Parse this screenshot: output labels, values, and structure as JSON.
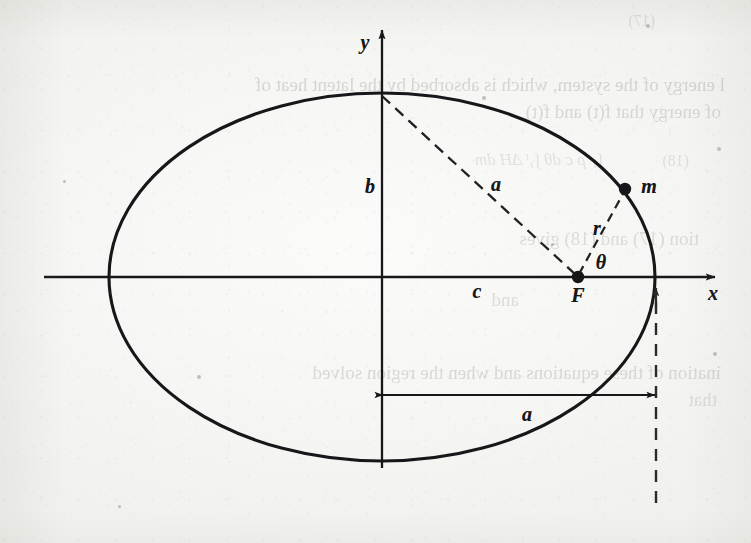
{
  "figure": {
    "kind": "ellipse-orbit-diagram",
    "caption_text": "",
    "ink_color": "#17171a",
    "paper_color": "#f6f6f4",
    "ghost_text_color": "#8d8a84"
  },
  "axes": {
    "x_label": "x",
    "y_label": "y",
    "x_axis": {
      "x1": 44,
      "y1": 277,
      "x2": 715,
      "y2": 277,
      "arrow": "right"
    },
    "y_axis": {
      "x1": 382,
      "y1": 468,
      "x2": 382,
      "y2": 30,
      "arrow": "up"
    },
    "x_label_pos": {
      "x": 713,
      "y": 293
    },
    "y_label_pos": {
      "x": 365,
      "y": 42
    }
  },
  "ellipse": {
    "center": {
      "x": 382,
      "y": 277
    },
    "semi_major_a": 273,
    "semi_minor_b": 184,
    "stroke_width": 3.1
  },
  "labels": {
    "semi_minor": {
      "text": "b",
      "x": 370,
      "y": 186
    },
    "focal_distance": {
      "text": "c",
      "x": 477,
      "y": 291
    },
    "semi_major_dashed": {
      "text": "a",
      "x": 496,
      "y": 184
    },
    "semi_major_dim": {
      "text": "a",
      "x": 527,
      "y": 414
    },
    "radius": {
      "text": "r",
      "x": 597,
      "y": 228
    },
    "angle": {
      "text": "θ",
      "x": 601,
      "y": 262
    },
    "focus_point": {
      "text": "F",
      "x": 578,
      "y": 295
    },
    "mass_point": {
      "text": "m",
      "x": 649,
      "y": 186
    }
  },
  "points": [
    {
      "name": "focus",
      "label": "F",
      "x": 578,
      "y": 277,
      "radius": 6.2
    },
    {
      "name": "orbiting-mass",
      "label": "m",
      "x": 625,
      "y": 189,
      "radius": 6.2
    }
  ],
  "dashed_lines": [
    {
      "name": "semi-major-axis-a",
      "x1": 382,
      "y1": 96,
      "x2": 576,
      "y2": 275
    },
    {
      "name": "radius-vector-r",
      "x1": 579,
      "y1": 274,
      "x2": 624,
      "y2": 192
    }
  ],
  "dimension_line": {
    "name": "semi-major-a-dimension",
    "x1": 383,
    "y1": 395,
    "x2": 655,
    "y2": 395,
    "arrows": "both",
    "label": "a"
  },
  "projection_line": {
    "name": "right-vertex-projection",
    "x": 656,
    "y_top": 288,
    "y_bottom": 509,
    "arrow": "up"
  },
  "chart_data": {
    "type": "scatter",
    "title": "",
    "xlabel": "x",
    "ylabel": "y",
    "annotations": [
      "a",
      "b",
      "c",
      "r",
      "θ",
      "F",
      "m",
      "a"
    ],
    "curve": {
      "name": "elliptical orbit",
      "equation": "x^2/a^2 + y^2/b^2 = 1",
      "center": [
        0,
        0
      ],
      "a": 273,
      "b": 184
    },
    "markers": [
      {
        "label": "F",
        "description": "focus of ellipse on positive x-axis",
        "x": 196,
        "y": 0
      },
      {
        "label": "m",
        "description": "orbiting mass on ellipse",
        "x": 243,
        "y": 88
      }
    ],
    "segments": [
      {
        "label": "a",
        "from": "top vertex (0, b)",
        "to": "F",
        "style": "dashed"
      },
      {
        "label": "r",
        "from": "F",
        "to": "m",
        "style": "dashed"
      },
      {
        "label": "b",
        "from": "center",
        "to": "top vertex",
        "style": "implied"
      },
      {
        "label": "c",
        "from": "center",
        "to": "F",
        "style": "implied"
      },
      {
        "label": "a",
        "from": "center",
        "to": "right vertex",
        "style": "dimension-arrow"
      }
    ]
  },
  "ghost_text": {
    "note": "faint mirrored show-through text from the reverse of the page",
    "lines": [
      {
        "text": "(17)",
        "x": 96,
        "y": 12,
        "size": 16,
        "italic": false,
        "opacity": 0.22
      },
      {
        "text": "l energy of the system, which is absorbed by the latent heat of",
        "x": 26,
        "y": 74,
        "size": 19,
        "italic": false,
        "opacity": 0.3
      },
      {
        "text": "of energy that f(t) and f(t)",
        "x": 30,
        "y": 101,
        "size": 19,
        "italic": false,
        "opacity": 0.28
      },
      {
        "text": "(18)",
        "x": 62,
        "y": 152,
        "size": 16,
        "italic": false,
        "opacity": 0.22
      },
      {
        "text": "∫₁ᵗ  ρ c   dθ      ∫₁ᵗ  ΔH   dm",
        "x": 148,
        "y": 150,
        "size": 17,
        "italic": true,
        "opacity": 0.2
      },
      {
        "text": "tion   (17) and (18) gives",
        "x": 52,
        "y": 228,
        "size": 19,
        "italic": false,
        "opacity": 0.26
      },
      {
        "text": "and",
        "x": 232,
        "y": 289,
        "size": 19,
        "italic": false,
        "opacity": 0.26
      },
      {
        "text": "ination of these equations and when the region solved",
        "x": 30,
        "y": 362,
        "size": 19,
        "italic": false,
        "opacity": 0.28
      },
      {
        "text": "that",
        "x": 34,
        "y": 389,
        "size": 19,
        "italic": false,
        "opacity": 0.24
      }
    ]
  }
}
